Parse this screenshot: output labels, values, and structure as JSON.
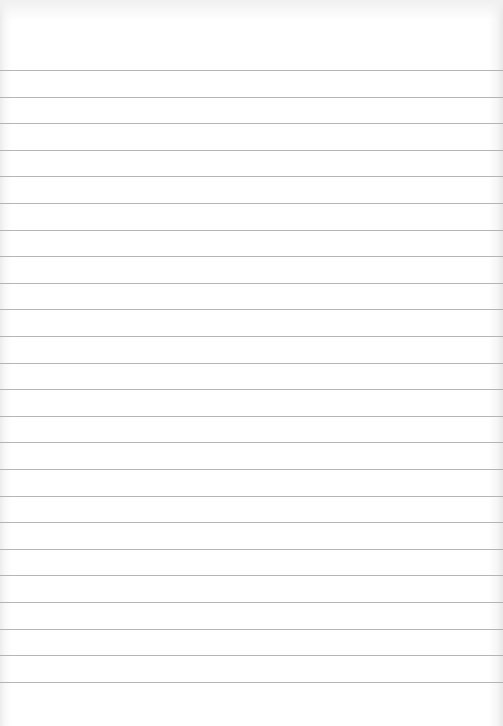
{
  "paper": {
    "type": "lined-notebook-page",
    "background_color": "#ffffff",
    "rule_color": "#a8a8a8",
    "rule_count": 24,
    "first_rule_y": 70,
    "rule_spacing": 26.6
  }
}
